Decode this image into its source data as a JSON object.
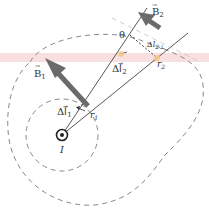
{
  "diagram": {
    "type": "physics-ampere-law",
    "labels": {
      "B1": "B⃗1",
      "B1_main": "B",
      "B1_sub": "1",
      "B2_main": "B",
      "B2_sub": "2",
      "dl1_main": "Δl⃗",
      "dl1_sub": "1",
      "dl2_main": "Δl⃗",
      "dl2_sub": "2",
      "r1_main": "r",
      "r1_sub": "1",
      "r2_main": "r",
      "r2_sub": "2",
      "theta": "θ",
      "dl2_perp_main": "Δl",
      "dl2_perp_sub": "2⊥",
      "current": "I"
    },
    "colors": {
      "line": "#555555",
      "arrow": "#6b6b6b",
      "dashed": "#888888",
      "highlight": "#f4b8b8",
      "dot": "#f3c98a"
    }
  }
}
